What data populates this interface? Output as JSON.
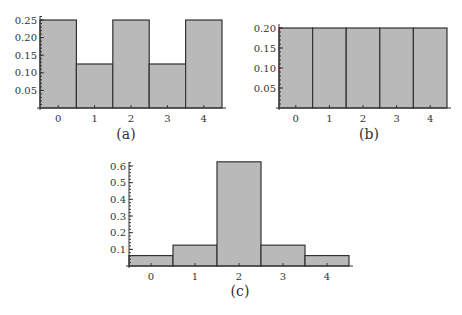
{
  "chart_data": [
    {
      "type": "bar",
      "caption": "(a)",
      "categories": [
        "0",
        "1",
        "2",
        "3",
        "4"
      ],
      "values": [
        0.25,
        0.125,
        0.25,
        0.125,
        0.25
      ],
      "yticks": [
        "0.05",
        "0.10",
        "0.15",
        "0.20",
        "0.25"
      ],
      "ylim": [
        0,
        0.25
      ],
      "title": "",
      "xlabel": "",
      "ylabel": "",
      "grid": false
    },
    {
      "type": "bar",
      "caption": "(b)",
      "categories": [
        "0",
        "1",
        "2",
        "3",
        "4"
      ],
      "values": [
        0.2,
        0.2,
        0.2,
        0.2,
        0.2
      ],
      "yticks": [
        "0.05",
        "0.10",
        "0.15",
        "0.20"
      ],
      "ylim": [
        0,
        0.2
      ],
      "title": "",
      "xlabel": "",
      "ylabel": "",
      "grid": false
    },
    {
      "type": "bar",
      "caption": "(c)",
      "categories": [
        "0",
        "1",
        "2",
        "3",
        "4"
      ],
      "values": [
        0.0625,
        0.125,
        0.625,
        0.125,
        0.0625
      ],
      "yticks": [
        "0.1",
        "0.2",
        "0.3",
        "0.4",
        "0.5",
        "0.6"
      ],
      "ylim": [
        0,
        0.65
      ],
      "title": "",
      "xlabel": "",
      "ylabel": "",
      "grid": false
    }
  ]
}
